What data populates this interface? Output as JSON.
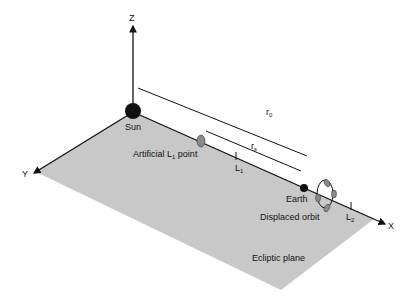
{
  "diagram": {
    "colors": {
      "plane": "#c8c8c8",
      "axis": "#111111",
      "sun": "#111111",
      "earth": "#111111",
      "sail": "#8a8a8a"
    },
    "axes": {
      "x": "X",
      "y": "Y",
      "z": "Z"
    },
    "labels": {
      "sun": "Sun",
      "earth": "Earth",
      "artificial_l1": "Artificial L",
      "artificial_l1_sub": "1",
      "artificial_l1_suffix": " point",
      "l1": "L",
      "l1_sub": "1",
      "l2": "L",
      "l2_sub": "2",
      "r0": "r",
      "r0_sub": "0",
      "rs": "r",
      "rs_sub": "s",
      "displaced_orbit": "Displaced orbit",
      "ecliptic_plane": "Ecliptic plane"
    }
  }
}
